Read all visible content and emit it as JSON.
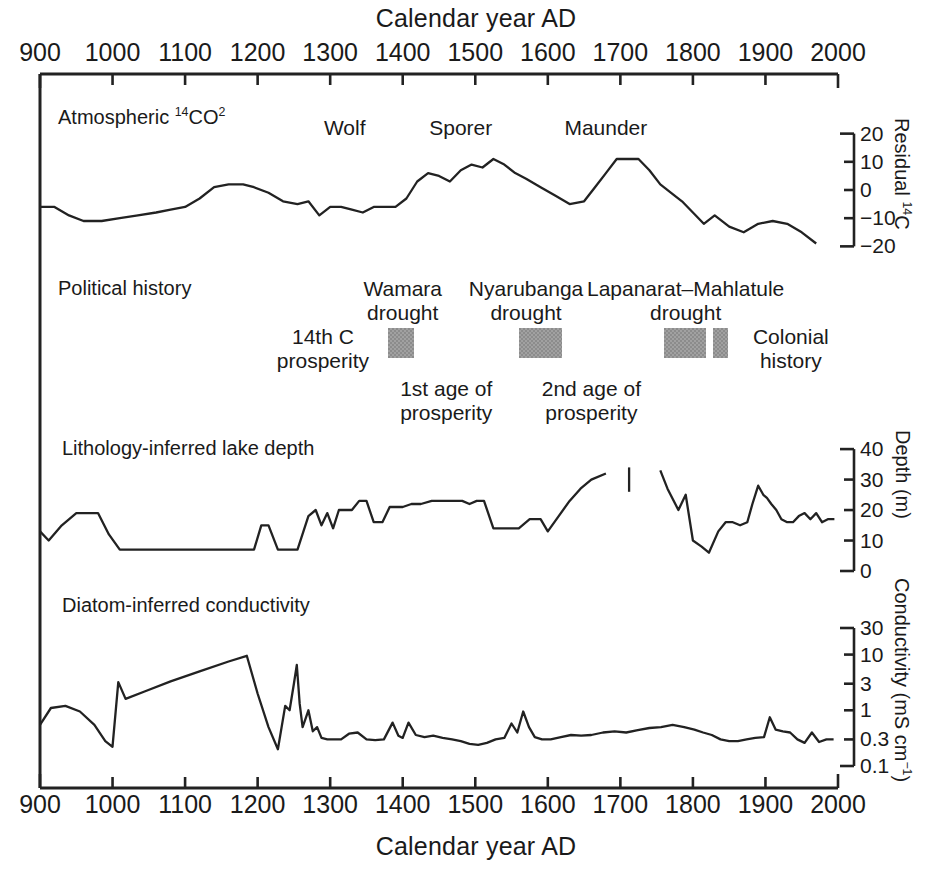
{
  "figure": {
    "top_axis_title": "Calendar year AD",
    "bottom_axis_title": "Calendar year AD"
  },
  "axes": {
    "x_ticks": [
      900,
      1000,
      1100,
      1200,
      1300,
      1400,
      1500,
      1600,
      1700,
      1800,
      1900,
      2000
    ],
    "x_tick_labels": [
      "900",
      "1000",
      "1100",
      "1200",
      "1300",
      "1400",
      "1500",
      "1600",
      "1700",
      "1800",
      "1900",
      "2000"
    ],
    "xlim": [
      900,
      2000
    ]
  },
  "panels": {
    "carbon": {
      "label_prefix": "Atmospheric ",
      "label_iso": "14",
      "label_main": "CO",
      "label_sub": "2",
      "label_full": "Atmospheric 14CO2",
      "y_axis_label_prefix": "Residual ",
      "y_axis_label_iso": "14",
      "y_axis_label_main": "C",
      "y_tick_labels": [
        "20",
        "10",
        "0",
        "−10",
        "−20"
      ],
      "y_ticks": [
        20,
        10,
        0,
        -10,
        -20
      ],
      "solar_minima": [
        {
          "name": "Wolf",
          "year": 1320
        },
        {
          "name": "Sporer",
          "year": 1480
        },
        {
          "name": "Maunder",
          "year": 1680
        }
      ]
    },
    "political": {
      "label": "Political history",
      "annotations": [
        {
          "name": "14th C prosperity",
          "lines": [
            "14th C",
            "prosperity"
          ],
          "year": 1290,
          "position": "left"
        },
        {
          "name": "Wamara drought",
          "lines": [
            "Wamara",
            "drought"
          ],
          "year": 1400,
          "position": "above"
        },
        {
          "name": "1st age of prosperity",
          "lines": [
            "1st age of",
            "prosperity"
          ],
          "year": 1460,
          "position": "below"
        },
        {
          "name": "Nyarubanga drought",
          "lines": [
            "Nyarubanga",
            "drought"
          ],
          "year": 1570,
          "position": "above"
        },
        {
          "name": "2nd age of prosperity",
          "lines": [
            "2nd age of",
            "prosperity"
          ],
          "year": 1660,
          "position": "below"
        },
        {
          "name": "Lapanarat–Mahlatule drought",
          "lines": [
            "Lapanarat–Mahlatule",
            "drought"
          ],
          "year": 1790,
          "position": "above"
        },
        {
          "name": "Colonial history",
          "lines": [
            "Colonial",
            "history"
          ],
          "year": 1935,
          "position": "right"
        }
      ],
      "drought_bars": [
        {
          "name": "wamara",
          "start_year": 1380,
          "end_year": 1415,
          "color": "#8c8c8c"
        },
        {
          "name": "nyarubanga",
          "start_year": 1560,
          "end_year": 1620,
          "color": "#8c8c8c"
        },
        {
          "name": "lapanarat-mahlatule",
          "start_year": 1760,
          "end_year": 1818,
          "color": "#8c8c8c"
        },
        {
          "name": "late-19th-century",
          "start_year": 1828,
          "end_year": 1848,
          "color": "#8c8c8c"
        }
      ]
    },
    "depth": {
      "label": "Lithology-inferred lake depth",
      "y_axis_label": "Depth (m)",
      "y_tick_labels": [
        "40",
        "30",
        "20",
        "10",
        "0"
      ],
      "y_ticks": [
        40,
        30,
        20,
        10,
        0
      ]
    },
    "conductivity": {
      "label": "Diatom-inferred conductivity",
      "y_axis_label_main": "Conductivity (mS cm",
      "y_axis_label_sup": "−1",
      "y_axis_label_close": ")",
      "y_tick_labels": [
        "30",
        "10",
        "3",
        "1",
        "0.3",
        "0.1"
      ],
      "y_ticks": [
        30,
        10,
        3,
        1,
        0.3,
        0.1
      ],
      "scale": "log"
    }
  },
  "chart_data": {
    "type": "line",
    "title": "",
    "xlabel": "Calendar year AD",
    "xlim": [
      900,
      2000
    ],
    "grid": false,
    "legend": "none",
    "subplots": [
      {
        "name": "atmospheric-14co2",
        "ylabel": "Residual 14C",
        "ylim": [
          -22,
          22
        ],
        "yticks": [
          20,
          10,
          0,
          -10,
          -20
        ],
        "series": [
          {
            "name": "Residual 14C",
            "x": [
              900,
              920,
              940,
              960,
              985,
              1010,
              1035,
              1060,
              1080,
              1100,
              1120,
              1140,
              1160,
              1180,
              1195,
              1215,
              1235,
              1255,
              1270,
              1285,
              1300,
              1315,
              1330,
              1345,
              1360,
              1375,
              1390,
              1405,
              1420,
              1435,
              1450,
              1465,
              1480,
              1495,
              1510,
              1525,
              1540,
              1555,
              1570,
              1590,
              1610,
              1630,
              1650,
              1665,
              1680,
              1695,
              1710,
              1725,
              1740,
              1755,
              1770,
              1785,
              1800,
              1815,
              1830,
              1850,
              1870,
              1890,
              1910,
              1930,
              1950,
              1970
            ],
            "y": [
              -6,
              -6,
              -9,
              -11,
              -11,
              -10,
              -9,
              -8,
              -7,
              -6,
              -3,
              1,
              2,
              2,
              1,
              -1,
              -4,
              -5,
              -4,
              -9,
              -6,
              -6,
              -7,
              -8,
              -6,
              -6,
              -6,
              -3,
              3,
              6,
              5,
              3,
              7,
              9,
              8,
              11,
              9,
              6,
              4,
              1,
              -2,
              -5,
              -4,
              1,
              6,
              11,
              11,
              11,
              7,
              2,
              -1,
              -4,
              -8,
              -12,
              -9,
              -13,
              -15,
              -12,
              -11,
              -12,
              -15,
              -19
            ]
          }
        ]
      },
      {
        "name": "lithology-inferred-lake-depth",
        "ylabel": "Depth (m)",
        "ylim": [
          0,
          42
        ],
        "yticks": [
          0,
          10,
          20,
          30,
          40
        ],
        "gap_marker_year": 1712,
        "series": [
          {
            "name": "segment-1",
            "x": [
              900,
              912,
              930,
              950,
              963,
              980,
              995,
              1010,
              1060,
              1110,
              1160,
              1195,
              1205,
              1215,
              1228,
              1240,
              1255,
              1270,
              1280,
              1288,
              1296,
              1304,
              1312,
              1320,
              1330,
              1340,
              1350,
              1360,
              1372,
              1382,
              1392,
              1400,
              1412,
              1425,
              1440,
              1452,
              1462,
              1472,
              1482,
              1492,
              1502,
              1512,
              1525,
              1535,
              1545,
              1560,
              1575,
              1590,
              1600,
              1615,
              1630,
              1645,
              1660,
              1680
            ],
            "y": [
              13,
              10,
              15,
              19,
              19,
              19,
              12,
              7,
              7,
              7,
              7,
              7,
              15,
              15,
              7,
              7,
              7,
              18,
              20,
              15,
              19,
              14,
              20,
              20,
              20,
              23,
              23,
              16,
              16,
              21,
              21,
              21,
              22,
              22,
              23,
              23,
              23,
              23,
              23,
              22,
              23,
              23,
              14,
              14,
              14,
              14,
              17,
              17,
              13,
              18,
              23,
              27,
              30,
              32
            ]
          },
          {
            "name": "segment-2",
            "x": [
              1755,
              1765,
              1780,
              1790,
              1800,
              1812,
              1822,
              1835,
              1845,
              1855,
              1865,
              1875,
              1882,
              1890,
              1897,
              1902,
              1908,
              1915,
              1922,
              1930,
              1938,
              1946,
              1954,
              1962,
              1970,
              1978,
              1986,
              1995
            ],
            "y": [
              33,
              27,
              20,
              25,
              10,
              8,
              6,
              13,
              16,
              16,
              15,
              16,
              22,
              28,
              25,
              24,
              22,
              20,
              17,
              16,
              16,
              18,
              19,
              17,
              19,
              16,
              17,
              17
            ]
          }
        ]
      },
      {
        "name": "diatom-inferred-conductivity",
        "ylabel": "Conductivity (mS cm-1)",
        "ylim": [
          0.08,
          40
        ],
        "yticks": [
          0.1,
          0.3,
          1,
          3,
          10,
          30
        ],
        "scale": "log",
        "series": [
          {
            "name": "Conductivity",
            "x": [
              900,
              915,
              935,
              955,
              975,
              990,
              1000,
              1008,
              1018,
              1045,
              1080,
              1120,
              1160,
              1185,
              1200,
              1215,
              1228,
              1238,
              1244,
              1250,
              1254,
              1258,
              1262,
              1266,
              1270,
              1276,
              1282,
              1288,
              1296,
              1305,
              1315,
              1326,
              1338,
              1350,
              1362,
              1374,
              1386,
              1394,
              1400,
              1408,
              1418,
              1430,
              1442,
              1455,
              1468,
              1480,
              1492,
              1504,
              1516,
              1528,
              1540,
              1550,
              1558,
              1566,
              1574,
              1582,
              1592,
              1604,
              1618,
              1632,
              1646,
              1660,
              1676,
              1692,
              1708,
              1724,
              1740,
              1756,
              1772,
              1788,
              1802,
              1814,
              1826,
              1838,
              1850,
              1862,
              1874,
              1886,
              1898,
              1906,
              1914,
              1924,
              1934,
              1944,
              1954,
              1964,
              1974,
              1984,
              1994
            ],
            "y": [
              0.55,
              1.1,
              1.2,
              0.95,
              0.55,
              0.28,
              0.22,
              3.2,
              1.6,
              2.2,
              3.3,
              5.0,
              7.5,
              9.5,
              2.0,
              0.5,
              0.2,
              1.2,
              1.0,
              3.0,
              6.5,
              1.3,
              0.5,
              0.7,
              1.0,
              0.42,
              0.5,
              0.32,
              0.3,
              0.3,
              0.3,
              0.38,
              0.4,
              0.3,
              0.29,
              0.3,
              0.6,
              0.35,
              0.32,
              0.6,
              0.36,
              0.33,
              0.35,
              0.32,
              0.3,
              0.28,
              0.25,
              0.24,
              0.26,
              0.3,
              0.32,
              0.58,
              0.4,
              0.95,
              0.5,
              0.33,
              0.3,
              0.3,
              0.33,
              0.36,
              0.35,
              0.36,
              0.4,
              0.42,
              0.4,
              0.44,
              0.48,
              0.5,
              0.55,
              0.5,
              0.45,
              0.4,
              0.36,
              0.3,
              0.28,
              0.28,
              0.3,
              0.32,
              0.33,
              0.75,
              0.45,
              0.42,
              0.4,
              0.3,
              0.26,
              0.4,
              0.27,
              0.3,
              0.3
            ]
          }
        ]
      }
    ]
  }
}
